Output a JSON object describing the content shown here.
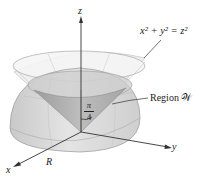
{
  "figure": {
    "labels": {
      "surface_equation": "x² + y² = z²",
      "region": "Region 𝒲",
      "axis_z": "z",
      "axis_y": "y",
      "axis_x": "x",
      "radius": "R",
      "angle_numerator": "π",
      "angle_denominator": "4"
    },
    "colors": {
      "cone_fill": "#ececec",
      "hemisphere_fill": "#d6d6d6",
      "inner_cone_fill": "#a9a9a9",
      "axis_line": "#333333",
      "grid_line": "#bdbdbd"
    }
  }
}
